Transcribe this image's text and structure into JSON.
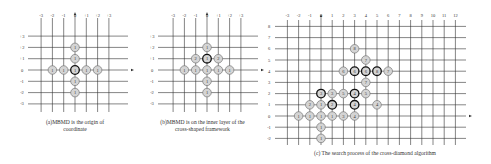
{
  "panels": [
    {
      "id": "a",
      "caption_line1": "(a)MBMD is the origin of",
      "caption_line2": "coordinate",
      "x_labels": [
        "-3",
        "-2",
        "-1",
        "0",
        "+1",
        "+2",
        "+3"
      ],
      "y_labels": [
        "+3",
        "+2",
        "+1",
        "0",
        "-1",
        "-2",
        "-3"
      ],
      "points": [
        {
          "x": 0,
          "y": 2,
          "label": "1"
        },
        {
          "x": 0,
          "y": 1,
          "label": "1"
        },
        {
          "x": -2,
          "y": 0,
          "label": "1"
        },
        {
          "x": -1,
          "y": 0,
          "label": "1"
        },
        {
          "x": 0,
          "y": 0,
          "label": "1",
          "bold": true
        },
        {
          "x": 1,
          "y": 0,
          "label": "1"
        },
        {
          "x": 2,
          "y": 0,
          "label": "1"
        },
        {
          "x": 0,
          "y": -1,
          "label": "1"
        },
        {
          "x": 0,
          "y": -2,
          "label": "1"
        }
      ]
    },
    {
      "id": "b",
      "caption_line1": "(b)MBMD is on the inner layer of the",
      "caption_line2": "cross-shaped framework",
      "x_labels": [
        "-3",
        "-2",
        "-1",
        "0",
        "+1",
        "+2",
        "+3"
      ],
      "y_labels": [
        "+3",
        "+2",
        "+1",
        "0",
        "-1",
        "-2",
        "-3"
      ],
      "points": [
        {
          "x": 0,
          "y": 2,
          "label": "1"
        },
        {
          "x": -1,
          "y": 1,
          "label": "2"
        },
        {
          "x": 0,
          "y": 1,
          "label": "1",
          "bold": true
        },
        {
          "x": 1,
          "y": 1,
          "label": "2"
        },
        {
          "x": -2,
          "y": 0,
          "label": "1"
        },
        {
          "x": -1,
          "y": 0,
          "label": "1"
        },
        {
          "x": 0,
          "y": 0,
          "label": "1"
        },
        {
          "x": 1,
          "y": 0,
          "label": "1"
        },
        {
          "x": 2,
          "y": 0,
          "label": "1"
        },
        {
          "x": 0,
          "y": -1,
          "label": "1"
        },
        {
          "x": 0,
          "y": -2,
          "label": "1"
        }
      ]
    },
    {
      "id": "c",
      "caption": "(c) The search process of the cross-diamond algorithm",
      "x_labels": [
        "-3",
        "-2",
        "-1",
        "0",
        "1",
        "2",
        "3",
        "4",
        "5",
        "6",
        "7",
        "8",
        "9",
        "10",
        "11",
        "12"
      ],
      "y_labels": [
        "8",
        "7",
        "6",
        "5",
        "4",
        "3",
        "2",
        "1",
        "0",
        "-1",
        "-2"
      ],
      "points": [
        {
          "x": 3,
          "y": 6,
          "label": "8"
        },
        {
          "x": 4,
          "y": 5,
          "label": "7"
        },
        {
          "x": 2,
          "y": 4,
          "label": "6"
        },
        {
          "x": 3,
          "y": 4,
          "label": "6",
          "bold": true
        },
        {
          "x": 4,
          "y": 4,
          "label": "6",
          "bold": true
        },
        {
          "x": 5,
          "y": 4,
          "label": "8",
          "bold": true
        },
        {
          "x": 6,
          "y": 4,
          "label": "7"
        },
        {
          "x": 4,
          "y": 3,
          "label": "7"
        },
        {
          "x": 0,
          "y": 2,
          "label": "3",
          "bold": true
        },
        {
          "x": 1,
          "y": 2,
          "label": "3"
        },
        {
          "x": 2,
          "y": 2,
          "label": "5"
        },
        {
          "x": 3,
          "y": 2,
          "label": "4",
          "bold": true
        },
        {
          "x": 4,
          "y": 2,
          "label": "5"
        },
        {
          "x": -1,
          "y": 1,
          "label": "2"
        },
        {
          "x": 0,
          "y": 1,
          "label": "1"
        },
        {
          "x": 1,
          "y": 1,
          "label": "2",
          "bold": true
        },
        {
          "x": 3,
          "y": 1,
          "label": "4",
          "bold": true
        },
        {
          "x": 5,
          "y": 1,
          "label": "4"
        },
        {
          "x": -2,
          "y": 0,
          "label": "1"
        },
        {
          "x": -1,
          "y": 0,
          "label": "1"
        },
        {
          "x": 0,
          "y": 0,
          "label": "1"
        },
        {
          "x": 1,
          "y": 0,
          "label": "1"
        },
        {
          "x": 2,
          "y": 0,
          "label": "3"
        },
        {
          "x": 3,
          "y": 0,
          "label": "4"
        },
        {
          "x": 0,
          "y": -1,
          "label": "1"
        },
        {
          "x": 0,
          "y": -2,
          "label": "1"
        }
      ]
    }
  ]
}
